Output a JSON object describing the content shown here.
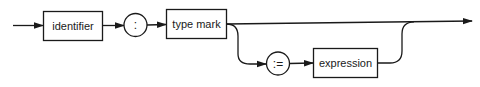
{
  "diagram": {
    "type": "syntax-diagram",
    "nodes": [
      {
        "id": "identifier",
        "kind": "nonterminal",
        "label": "identifier"
      },
      {
        "id": "colon",
        "kind": "terminal",
        "label": ":"
      },
      {
        "id": "type_mark",
        "kind": "nonterminal",
        "label": "type mark"
      },
      {
        "id": "assign",
        "kind": "terminal",
        "label": ":="
      },
      {
        "id": "expression",
        "kind": "nonterminal",
        "label": "expression"
      }
    ],
    "edges": [
      {
        "from": "start",
        "to": "identifier"
      },
      {
        "from": "identifier",
        "to": "colon"
      },
      {
        "from": "colon",
        "to": "type_mark"
      },
      {
        "from": "type_mark",
        "to": "end"
      },
      {
        "from": "type_mark",
        "to": "assign",
        "optional_branch": true
      },
      {
        "from": "assign",
        "to": "expression"
      },
      {
        "from": "expression",
        "to": "end"
      }
    ],
    "colors": {
      "stroke": "#1a1a1a",
      "background": "#ffffff"
    }
  }
}
